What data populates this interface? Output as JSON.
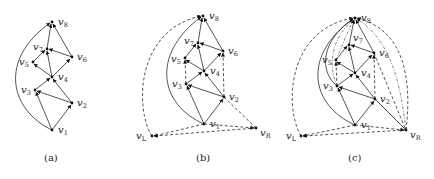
{
  "figure": {
    "panels": [
      {
        "caption": "(a)",
        "nodes": [
          {
            "id": "v1",
            "label": "v",
            "sub": "1",
            "x": 52,
            "y": 130,
            "lx": 58,
            "ly": 133
          },
          {
            "id": "v2",
            "label": "v",
            "sub": "2",
            "x": 72,
            "y": 103,
            "lx": 77,
            "ly": 106
          },
          {
            "id": "v3",
            "label": "v",
            "sub": "3",
            "x": 35,
            "y": 90,
            "lx": 21,
            "ly": 93
          },
          {
            "id": "v4",
            "label": "v",
            "sub": "4",
            "x": 52,
            "y": 77,
            "lx": 58,
            "ly": 80
          },
          {
            "id": "v5",
            "label": "v",
            "sub": "5",
            "x": 33,
            "y": 62,
            "lx": 19,
            "ly": 65
          },
          {
            "id": "v6",
            "label": "v",
            "sub": "6",
            "x": 72,
            "y": 57,
            "lx": 77,
            "ly": 60
          },
          {
            "id": "v7",
            "label": "v",
            "sub": "7",
            "x": 47,
            "y": 49,
            "lx": 33,
            "ly": 50
          },
          {
            "id": "v8",
            "label": "v",
            "sub": "8",
            "x": 52,
            "y": 22,
            "lx": 58,
            "ly": 25
          }
        ]
      },
      {
        "caption": "(b)",
        "nodes": [
          {
            "id": "v1",
            "label": "v",
            "sub": "1",
            "x": 204,
            "y": 124,
            "lx": 210,
            "ly": 127
          },
          {
            "id": "v2",
            "label": "v",
            "sub": "2",
            "x": 224,
            "y": 97,
            "lx": 229,
            "ly": 100
          },
          {
            "id": "v3",
            "label": "v",
            "sub": "3",
            "x": 186,
            "y": 84,
            "lx": 172,
            "ly": 87
          },
          {
            "id": "v4",
            "label": "v",
            "sub": "4",
            "x": 204,
            "y": 71,
            "lx": 210,
            "ly": 74
          },
          {
            "id": "v5",
            "label": "v",
            "sub": "5",
            "x": 185,
            "y": 58,
            "lx": 171,
            "ly": 62
          },
          {
            "id": "v6",
            "label": "v",
            "sub": "6",
            "x": 223,
            "y": 51,
            "lx": 228,
            "ly": 54
          },
          {
            "id": "v7",
            "label": "v",
            "sub": "7",
            "x": 198,
            "y": 43,
            "lx": 184,
            "ly": 44
          },
          {
            "id": "v8",
            "label": "v",
            "sub": "8",
            "x": 203,
            "y": 16,
            "lx": 209,
            "ly": 19
          },
          {
            "id": "vL",
            "label": "v",
            "sub": "L",
            "x": 152,
            "y": 136,
            "lx": 136,
            "ly": 139
          },
          {
            "id": "vR",
            "label": "v",
            "sub": "R",
            "x": 256,
            "y": 128,
            "lx": 260,
            "ly": 136
          }
        ]
      },
      {
        "caption": "(c)",
        "nodes": [
          {
            "id": "v1",
            "label": "v",
            "sub": "1",
            "x": 355,
            "y": 125,
            "lx": 361,
            "ly": 128
          },
          {
            "id": "v2",
            "label": "v",
            "sub": "2",
            "x": 375,
            "y": 99,
            "lx": 380,
            "ly": 102
          },
          {
            "id": "v3",
            "label": "v",
            "sub": "3",
            "x": 337,
            "y": 86,
            "lx": 323,
            "ly": 89
          },
          {
            "id": "v4",
            "label": "v",
            "sub": "4",
            "x": 355,
            "y": 73,
            "lx": 361,
            "ly": 76
          },
          {
            "id": "v5",
            "label": "v",
            "sub": "5",
            "x": 336,
            "y": 60,
            "lx": 322,
            "ly": 63
          },
          {
            "id": "v6",
            "label": "v",
            "sub": "6",
            "x": 374,
            "y": 53,
            "lx": 379,
            "ly": 56
          },
          {
            "id": "v7",
            "label": "v",
            "sub": "7",
            "x": 349,
            "y": 45,
            "lx": 353,
            "ly": 41
          },
          {
            "id": "v8",
            "label": "v",
            "sub": "8",
            "x": 355,
            "y": 18,
            "lx": 361,
            "ly": 21
          },
          {
            "id": "vL",
            "label": "v",
            "sub": "L",
            "x": 301,
            "y": 136,
            "lx": 286,
            "ly": 139
          },
          {
            "id": "vR",
            "label": "v",
            "sub": "R",
            "x": 406,
            "y": 130,
            "lx": 410,
            "ly": 138
          }
        ]
      }
    ]
  },
  "background_bleed": [
    "                                                  ...                                                                       ",
    "                                                                                                                            "
  ]
}
